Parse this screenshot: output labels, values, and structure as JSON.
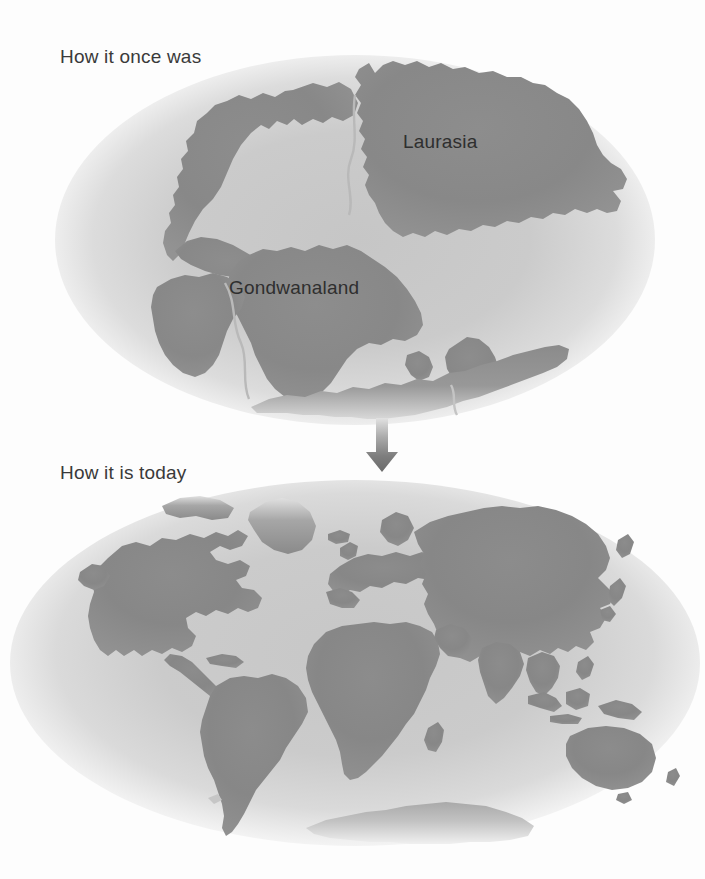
{
  "figure": {
    "type": "two-panel continental drift illustration",
    "background_color": "#fdfdfd",
    "land_color": "#878787",
    "ocean_color": "#c9c9c9",
    "text_color": "#3a3a3a"
  },
  "panels": {
    "past": {
      "caption": "How it once was",
      "labels": {
        "laurasia": "Laurasia",
        "gondwanaland": "Gondwanaland"
      }
    },
    "today": {
      "caption": "How it is today"
    }
  },
  "arrow": {
    "name": "down-arrow",
    "direction": "down"
  },
  "bleedthrough": {
    "line1": "",
    "line2": "",
    "line3": ""
  }
}
